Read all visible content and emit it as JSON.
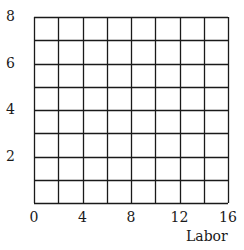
{
  "chart_data": {
    "type": "line",
    "title": "",
    "xlabel": "Labor",
    "ylabel": "",
    "xlim": [
      0,
      16
    ],
    "ylim": [
      0,
      8
    ],
    "x_ticks": [
      0,
      4,
      8,
      12,
      16
    ],
    "y_ticks": [
      2,
      4,
      6,
      8
    ],
    "x_ticklabels": [
      "0",
      "4",
      "8",
      "12",
      "16"
    ],
    "y_ticklabels": [
      "2",
      "4",
      "6",
      "8"
    ],
    "grid": true,
    "grid_x_step": 2,
    "grid_y_step": 1,
    "series": [],
    "legend": null
  },
  "colors": {
    "grid": "#1a1a1a",
    "text": "#1a1a1a",
    "background": "#ffffff"
  }
}
